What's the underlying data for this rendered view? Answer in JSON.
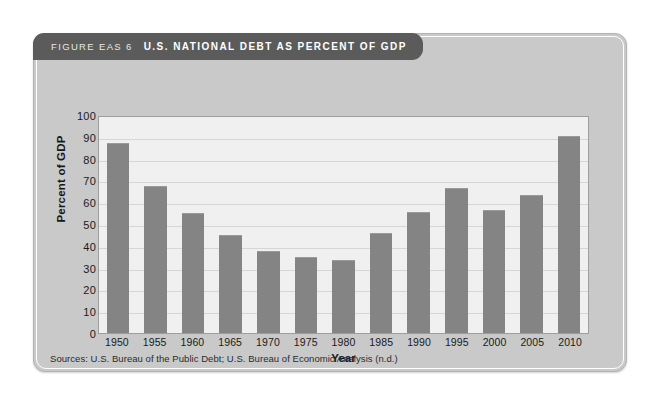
{
  "figure": {
    "label": "FIGURE EAS 6",
    "title": "U.S. NATIONAL DEBT AS PERCENT OF GDP",
    "source_note": "Sources: U.S. Bureau of the Public Debt; U.S. Bureau of Economic Analysis (n.d.)",
    "colors": {
      "header_bar": "#5b5b5b",
      "card_background": "#c9c9c9",
      "plot_background": "#f0f0f0",
      "bar_fill": "#848484",
      "gridline": "#d6d6d6"
    }
  },
  "chart_data": {
    "type": "bar",
    "title": "U.S. NATIONAL DEBT AS PERCENT OF GDP",
    "xlabel": "Year",
    "ylabel": "Percent of GDP",
    "categories": [
      "1950",
      "1955",
      "1960",
      "1965",
      "1970",
      "1975",
      "1980",
      "1985",
      "1990",
      "1995",
      "2000",
      "2005",
      "2010"
    ],
    "values": [
      87,
      67.5,
      55,
      45,
      37.5,
      35,
      33.5,
      46,
      55.5,
      66.5,
      56.5,
      63.5,
      90.5
    ],
    "ylim": [
      0,
      100
    ],
    "ytick_step": 10,
    "yticks": [
      "100",
      "90",
      "80",
      "70",
      "60",
      "50",
      "40",
      "30",
      "20",
      "10",
      "0"
    ],
    "grid": true,
    "legend": "none",
    "series": [
      {
        "name": "U.S. national debt as percent of GDP",
        "values": [
          87,
          67.5,
          55,
          45,
          37.5,
          35,
          33.5,
          46,
          55.5,
          66.5,
          56.5,
          63.5,
          90.5
        ]
      }
    ]
  }
}
